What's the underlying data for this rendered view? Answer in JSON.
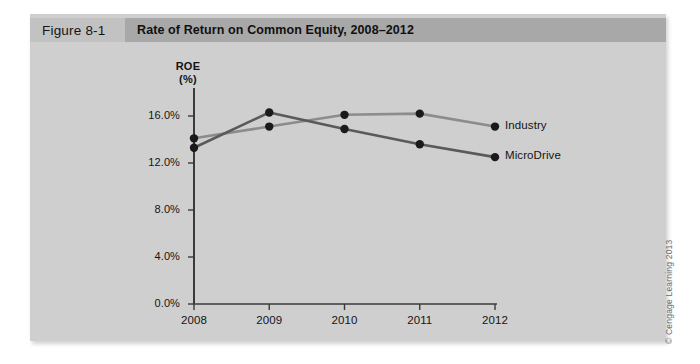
{
  "figure": {
    "number_label": "Figure 8-1",
    "title": "Rate of Return on Common Equity, 2008–2012"
  },
  "copyright": "© Cengage Learning 2013",
  "colors": {
    "panel_background": "#cfcfcf",
    "caption_number_bg": "#c2c2c2",
    "caption_title_bg": "#a8a8a8",
    "axis": "#3a3a3a",
    "industry_line": "#8c8c8c",
    "microdrive_line": "#5a5a5a",
    "marker": "#1a1a1a",
    "text": "#141414"
  },
  "chart_data": {
    "type": "line",
    "title": "Rate of Return on Common Equity, 2008–2012",
    "xlabel": "",
    "ylabel": "ROE (%)",
    "ylabel_line1": "ROE",
    "ylabel_line2": "(%)",
    "categories": [
      "2008",
      "2009",
      "2010",
      "2011",
      "2012"
    ],
    "x": [
      2008,
      2009,
      2010,
      2011,
      2012
    ],
    "ylim": [
      0.0,
      16.0
    ],
    "yticks": [
      0.0,
      4.0,
      8.0,
      12.0,
      16.0
    ],
    "ytick_labels": [
      "0.0%",
      "4.0%",
      "8.0%",
      "12.0%",
      "16.0%"
    ],
    "grid": false,
    "legend_position": "right-inline-labels",
    "series": [
      {
        "name": "Industry",
        "label": "Industry",
        "color": "#8c8c8c",
        "values": [
          14.1,
          15.1,
          16.1,
          16.2,
          15.1
        ]
      },
      {
        "name": "MicroDrive",
        "label": "MicroDrive",
        "color": "#5a5a5a",
        "values": [
          13.3,
          16.3,
          14.9,
          13.6,
          12.5
        ]
      }
    ]
  }
}
